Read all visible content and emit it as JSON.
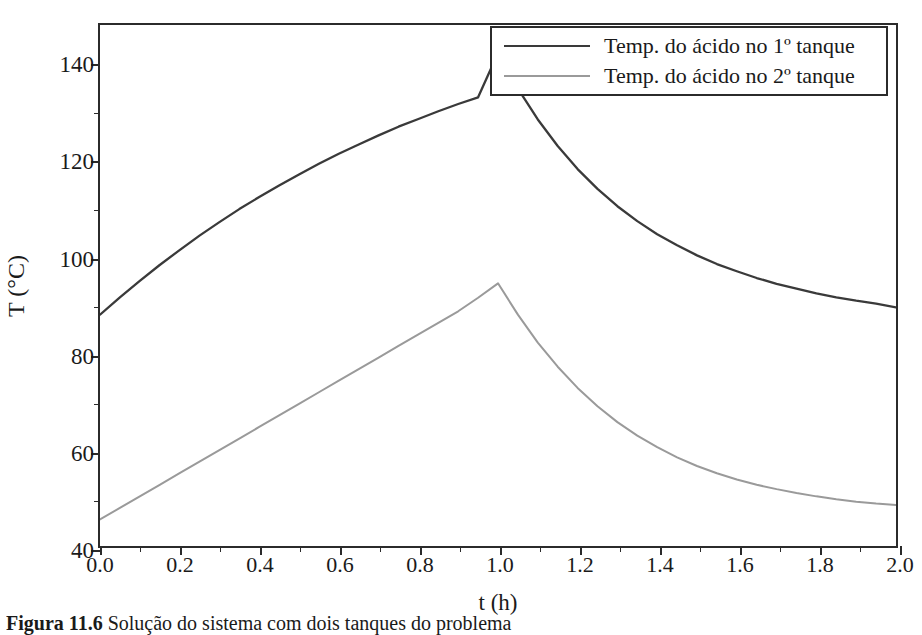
{
  "figure": {
    "caption_label": "Figura 11.6",
    "caption_body": "Solução do sistema com dois tanques do problema"
  },
  "chart_data": {
    "type": "line",
    "title": "",
    "xlabel": "t (h)",
    "ylabel": "T (°C)",
    "xlim": [
      0.0,
      2.0
    ],
    "ylim": [
      40,
      148.1
    ],
    "grid": false,
    "legend_position": "top-right",
    "xticks": [
      0.0,
      0.2,
      0.4,
      0.6,
      0.8,
      1.0,
      1.2,
      1.4,
      1.6,
      1.8,
      2.0
    ],
    "xtick_labels": [
      "0.0",
      "0.2",
      "0.4",
      "0.6",
      "0.8",
      "1.0",
      "1.2",
      "1.4",
      "1.6",
      "1.8",
      "2.0"
    ],
    "xticks_minor": [
      0.1,
      0.3,
      0.5,
      0.7,
      0.9,
      1.1,
      1.3,
      1.5,
      1.7,
      1.9
    ],
    "yticks": [
      40,
      60,
      80,
      100,
      120,
      140
    ],
    "ytick_labels": [
      "40",
      "60",
      "80",
      "100",
      "120",
      "140"
    ],
    "yticks_minor": [
      50,
      70,
      90,
      110,
      130
    ],
    "series": [
      {
        "name": "Temp. do ácido no 1º tanque",
        "color": "#3a3a3a",
        "width": 2.3,
        "x": [
          0.0,
          0.05,
          0.1,
          0.15,
          0.2,
          0.25,
          0.3,
          0.35,
          0.4,
          0.45,
          0.5,
          0.55,
          0.6,
          0.65,
          0.7,
          0.75,
          0.8,
          0.85,
          0.9,
          0.95,
          1.0,
          1.05,
          1.1,
          1.15,
          1.2,
          1.25,
          1.3,
          1.35,
          1.4,
          1.45,
          1.5,
          1.55,
          1.6,
          1.65,
          1.7,
          1.75,
          1.8,
          1.85,
          1.9,
          1.95,
          2.0
        ],
        "y": [
          88.0,
          91.6,
          95.0,
          98.3,
          101.4,
          104.4,
          107.2,
          109.9,
          112.4,
          114.8,
          117.1,
          119.3,
          121.4,
          123.3,
          125.2,
          127.0,
          128.6,
          130.2,
          131.7,
          133.1,
          142.3,
          134.9,
          128.5,
          123.0,
          118.2,
          114.1,
          110.5,
          107.4,
          104.7,
          102.4,
          100.3,
          98.5,
          97.0,
          95.6,
          94.4,
          93.4,
          92.4,
          91.6,
          90.9,
          90.3,
          89.5
        ]
      },
      {
        "name": "Temp. do ácido no 2º tanque",
        "color": "#9a9a9a",
        "width": 2.0,
        "x": [
          0.0,
          0.05,
          0.1,
          0.15,
          0.2,
          0.25,
          0.3,
          0.35,
          0.4,
          0.45,
          0.5,
          0.55,
          0.6,
          0.65,
          0.7,
          0.75,
          0.8,
          0.85,
          0.9,
          0.95,
          1.0,
          1.05,
          1.1,
          1.15,
          1.2,
          1.25,
          1.3,
          1.35,
          1.4,
          1.45,
          1.5,
          1.55,
          1.6,
          1.65,
          1.7,
          1.75,
          1.8,
          1.85,
          1.9,
          1.95,
          2.0
        ],
        "y": [
          45.5,
          47.9,
          50.3,
          52.7,
          55.1,
          57.5,
          59.9,
          62.3,
          64.7,
          67.1,
          69.5,
          71.9,
          74.3,
          76.7,
          79.1,
          81.5,
          83.9,
          86.3,
          88.7,
          91.5,
          94.5,
          88.0,
          82.2,
          77.2,
          72.8,
          69.0,
          65.7,
          62.9,
          60.5,
          58.4,
          56.6,
          55.1,
          53.8,
          52.7,
          51.8,
          51.0,
          50.3,
          49.7,
          49.2,
          48.8,
          48.5
        ]
      }
    ]
  }
}
